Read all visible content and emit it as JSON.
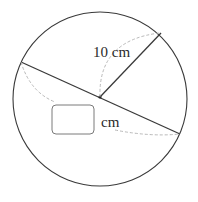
{
  "figure": {
    "type": "circle-diagram",
    "radius_label": "10 cm",
    "diameter_unit_label": "cm",
    "answer_box": {
      "value": "",
      "placeholder": ""
    },
    "colors": {
      "stroke": "#3a3a3a",
      "dashed": "#b0b0b0",
      "box": "#7a7a7a"
    }
  }
}
